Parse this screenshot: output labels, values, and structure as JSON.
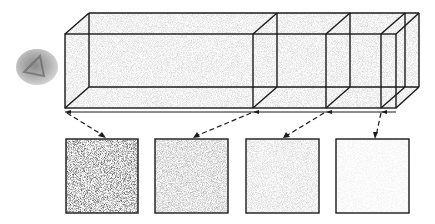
{
  "diagram": {
    "colors": {
      "line": "#1a1a1a",
      "background": "#ffffff",
      "volume_fill": "#dcdcdc"
    },
    "sphere": {
      "cx": 37,
      "cy": 67,
      "rx": 21,
      "ry": 18,
      "fill": "#bdbdbd"
    },
    "volume": {
      "front_left": 65,
      "front_top": 34,
      "front_bottom": 108,
      "depth_dx": 24,
      "depth_dy": -21,
      "front_right": 396,
      "slice_fronts": [
        253,
        326,
        381
      ]
    },
    "baseline": {
      "y": 112,
      "x1": 65,
      "x2": 396
    },
    "patches": [
      {
        "label": "patch-1",
        "x": 66,
        "y": 139,
        "w": 72,
        "h": 74,
        "shade": "#8a8a8a",
        "density": 0.55,
        "source_x": 65
      },
      {
        "label": "patch-2",
        "x": 155,
        "y": 139,
        "w": 73,
        "h": 74,
        "shade": "#c4c4c4",
        "density": 0.35,
        "source_x": 253
      },
      {
        "label": "patch-3",
        "x": 246,
        "y": 139,
        "w": 73,
        "h": 74,
        "shade": "#d8d8d8",
        "density": 0.25,
        "source_x": 326
      },
      {
        "label": "patch-4",
        "x": 336,
        "y": 139,
        "w": 73,
        "h": 74,
        "shade": "#efefef",
        "density": 0.1,
        "source_x": 381
      }
    ]
  }
}
